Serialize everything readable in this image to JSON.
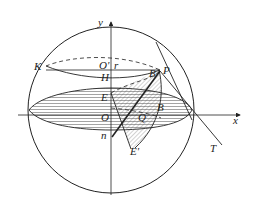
{
  "diagram": {
    "type": "sphere-geometry",
    "labels": {
      "y_axis": "y",
      "x_axis": "x",
      "K": "K",
      "O_prime": "O'",
      "r": "r",
      "H": "H",
      "E": "E",
      "O": "O",
      "n": "n",
      "B_upper": "B",
      "P": "P",
      "B": "B",
      "Q": "Q",
      "E_prime": "E'",
      "T": "T"
    },
    "colors": {
      "line": "#222222",
      "hatch": "#555555",
      "background": "#ffffff"
    }
  }
}
